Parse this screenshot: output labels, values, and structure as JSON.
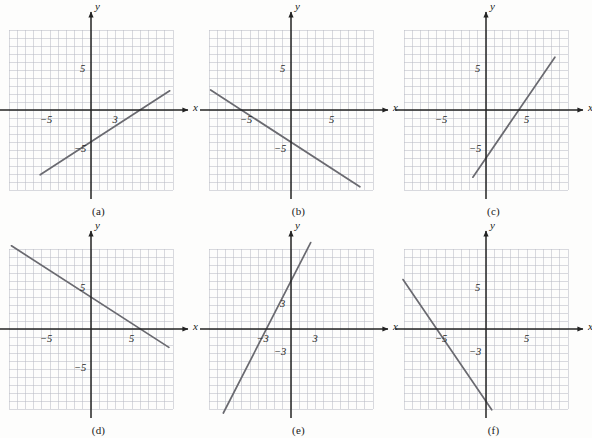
{
  "figure": {
    "type": "math-graph-grid",
    "background_color": "#fdfdfc",
    "grid_line_color": "#b9bcc4",
    "axis_color": "#232323",
    "plot_line_color": "#6a6a70",
    "panel_columns": 3,
    "panel_rows": 2
  },
  "axis_labels": {
    "x": "x",
    "y": "y"
  },
  "chart_data": [
    {
      "type": "line",
      "id": "a",
      "caption": "(a)",
      "title": "",
      "xlabel": "x",
      "ylabel": "y",
      "xlim": [
        -10,
        10
      ],
      "ylim": [
        -10,
        10
      ],
      "grid": true,
      "grid_step": 1,
      "tick_labels": [
        {
          "axis": "y",
          "value": 5,
          "text": "5"
        },
        {
          "axis": "x",
          "value": -5,
          "text": "−5"
        },
        {
          "axis": "x",
          "value": 3,
          "text": "3"
        },
        {
          "axis": "y",
          "value": -5,
          "text": "−5"
        }
      ],
      "line": {
        "slope": 0.6666,
        "intercept": -4,
        "equation": "y = (2/3)x − 4"
      },
      "segment": {
        "x1": -6.2,
        "y1": -8.1,
        "x2": 9.6,
        "y2": 2.4
      }
    },
    {
      "type": "line",
      "id": "b",
      "caption": "(b)",
      "title": "",
      "xlabel": "x",
      "ylabel": "y",
      "xlim": [
        -10,
        10
      ],
      "ylim": [
        -10,
        10
      ],
      "grid": true,
      "grid_step": 1,
      "tick_labels": [
        {
          "axis": "y",
          "value": 5,
          "text": "5"
        },
        {
          "axis": "x",
          "value": -5,
          "text": "−5"
        },
        {
          "axis": "x",
          "value": 5,
          "text": "5"
        },
        {
          "axis": "y",
          "value": -5,
          "text": "−5"
        }
      ],
      "line": {
        "slope": -0.6666,
        "intercept": -4,
        "equation": "y = −(2/3)x − 4"
      },
      "segment": {
        "x1": -9.8,
        "y1": 2.5,
        "x2": 8.4,
        "y2": -9.6
      }
    },
    {
      "type": "line",
      "id": "c",
      "caption": "(c)",
      "title": "",
      "xlabel": "x",
      "ylabel": "y",
      "xlim": [
        -10,
        10
      ],
      "ylim": [
        -10,
        10
      ],
      "grid": true,
      "grid_step": 1,
      "tick_labels": [
        {
          "axis": "y",
          "value": 5,
          "text": "5"
        },
        {
          "axis": "x",
          "value": -5,
          "text": "−5"
        },
        {
          "axis": "x",
          "value": 5,
          "text": "5"
        },
        {
          "axis": "y",
          "value": -5,
          "text": "−5"
        }
      ],
      "line": {
        "slope": 1.5,
        "intercept": -6,
        "equation": "y = (3/2)x − 6"
      },
      "segment": {
        "x1": -1.6,
        "y1": -8.4,
        "x2": 8.4,
        "y2": 6.6
      }
    },
    {
      "type": "line",
      "id": "d",
      "caption": "(d)",
      "title": "",
      "xlabel": "x",
      "ylabel": "y",
      "xlim": [
        -10,
        10
      ],
      "ylim": [
        -10,
        10
      ],
      "grid": true,
      "grid_step": 1,
      "tick_labels": [
        {
          "axis": "y",
          "value": 5,
          "text": "5"
        },
        {
          "axis": "x",
          "value": -5,
          "text": "−5"
        },
        {
          "axis": "x",
          "value": 5,
          "text": "5"
        },
        {
          "axis": "y",
          "value": -5,
          "text": "−5"
        }
      ],
      "line": {
        "slope": -0.6666,
        "intercept": 4,
        "equation": "y = −(2/3)x + 4"
      },
      "segment": {
        "x1": -9.7,
        "y1": 10.4,
        "x2": 9.5,
        "y2": -2.3
      }
    },
    {
      "type": "line",
      "id": "e",
      "caption": "(e)",
      "title": "",
      "xlabel": "x",
      "ylabel": "y",
      "xlim": [
        -10,
        10
      ],
      "ylim": [
        -10,
        10
      ],
      "grid": true,
      "grid_step": 1,
      "tick_labels": [
        {
          "axis": "y",
          "value": 3,
          "text": "3"
        },
        {
          "axis": "x",
          "value": -3,
          "text": "−3"
        },
        {
          "axis": "x",
          "value": 3,
          "text": "3"
        },
        {
          "axis": "y",
          "value": -3,
          "text": "−3"
        }
      ],
      "line": {
        "slope": 2,
        "intercept": 6,
        "equation": "y = 2x + 6"
      },
      "segment": {
        "x1": -9.6,
        "y1": -13.2,
        "x2": 2.4,
        "y2": 10.8
      }
    },
    {
      "type": "line",
      "id": "f",
      "caption": "(f)",
      "title": "",
      "xlabel": "x",
      "ylabel": "y",
      "xlim": [
        -10,
        10
      ],
      "ylim": [
        -10,
        10
      ],
      "grid": true,
      "grid_step": 1,
      "tick_labels": [
        {
          "axis": "y",
          "value": 5,
          "text": "5"
        },
        {
          "axis": "x",
          "value": -5,
          "text": "−5"
        },
        {
          "axis": "x",
          "value": 5,
          "text": "5"
        },
        {
          "axis": "y",
          "value": -3,
          "text": "−3"
        }
      ],
      "line": {
        "slope": -1.5,
        "intercept": -9,
        "equation": "y = −(3/2)x − 9"
      },
      "segment": {
        "x1": -10.2,
        "y1": 6.3,
        "x2": 0.7,
        "y2": -10.1
      }
    }
  ]
}
